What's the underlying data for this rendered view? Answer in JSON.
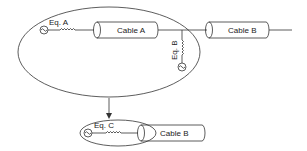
{
  "diagram": {
    "top_group": {
      "equivalent_a": {
        "label": "Eq. A"
      },
      "equivalent_b": {
        "label": "Eq. B"
      },
      "cable_a": {
        "label": "Cable A"
      }
    },
    "cable_b_top": {
      "label": "Cable B"
    },
    "reduced_group": {
      "equivalent_c": {
        "label": "Eq. C"
      },
      "cable_b": {
        "label": "Cable B"
      }
    },
    "colors": {
      "stroke": "#333333",
      "background": "#ffffff"
    }
  }
}
